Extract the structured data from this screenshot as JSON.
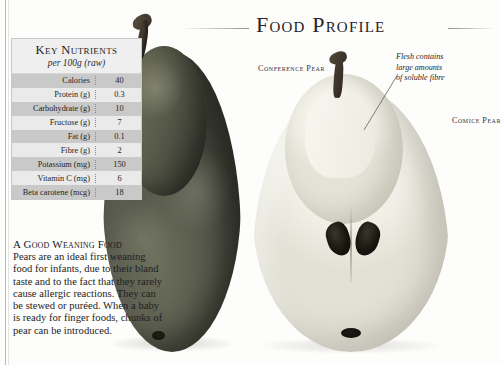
{
  "header": {
    "title": "Food Profile"
  },
  "nutrition_table": {
    "title": "Key Nutrients",
    "subtitle": "per 100g (raw)",
    "columns": [
      "Nutrient",
      "Amount"
    ],
    "rows": [
      {
        "label": "Calories",
        "value": "40"
      },
      {
        "label": "Protein (g)",
        "value": "0.3"
      },
      {
        "label": "Carbohydrate (g)",
        "value": "10"
      },
      {
        "label": "Fructose (g)",
        "value": "7"
      },
      {
        "label": "Fat (g)",
        "value": "0.1"
      },
      {
        "label": "Fibre (g)",
        "value": "2"
      },
      {
        "label": "Potassium (mg)",
        "value": "150"
      },
      {
        "label": "Vitamin C (mg)",
        "value": "6"
      },
      {
        "label": "Beta carotene (mcg)",
        "value": "18"
      }
    ]
  },
  "weaning": {
    "heading": "A Good Weaning Food",
    "body": "Pears are an ideal first weaning food for infants, due to their bland taste and to the fact that they rarely cause allergic reactions. They can be stewed or puréed. When a baby is ready for finger foods, chunks of pear can be introduced."
  },
  "labels": {
    "conference": "Conference Pear",
    "comice": "Comice Pear"
  },
  "annotation": {
    "line1": "Flesh contains",
    "line2": "large amounts",
    "line3": "of soluble fibre"
  },
  "colors": {
    "page_background": "#fdfdfc",
    "title_text": "#23232a",
    "table_border": "#c8c8c8",
    "row_odd": "#c9c9c9",
    "row_even": "#eaeaea",
    "whole_pear": "#55574a",
    "half_pear_flesh": "#f0efe6",
    "seed": "#17150f"
  }
}
